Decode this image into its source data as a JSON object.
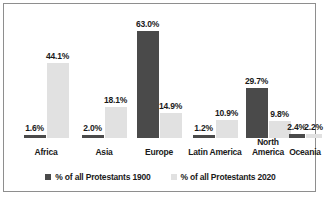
{
  "chart_data": {
    "type": "bar",
    "title": "",
    "xlabel": "",
    "ylabel": "",
    "grid": false,
    "legend_position": "bottom",
    "ylim": [
      0,
      66
    ],
    "categories": [
      "Africa",
      "Asia",
      "Europe",
      "Latin America",
      "North\nAmerica",
      "Oceania"
    ],
    "series": [
      {
        "name": "% of all Protestants 1900",
        "color": "#4a4a4a",
        "values": [
          1.6,
          2.0,
          63.0,
          1.2,
          29.7,
          2.4
        ],
        "labels": [
          "1.6%",
          "2.0%",
          "63.0%",
          "1.2%",
          "29.7%",
          "2.4%"
        ]
      },
      {
        "name": "% of all Protestants 2020",
        "color": "#e1e1e1",
        "values": [
          44.1,
          18.1,
          14.9,
          10.9,
          9.8,
          2.2
        ],
        "labels": [
          "44.1%",
          "18.1%",
          "14.9%",
          "10.9%",
          "9.8%",
          "2.2%"
        ]
      }
    ]
  },
  "legend": {
    "items": [
      {
        "label": "% of all Protestants 1900",
        "color": "#4a4a4a"
      },
      {
        "label": "% of all Protestants 2020",
        "color": "#e1e1e1"
      }
    ]
  }
}
